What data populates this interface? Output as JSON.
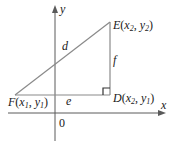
{
  "diagram": {
    "type": "right-triangle-distance",
    "axes": {
      "x_label": "x",
      "y_label": "y",
      "origin_label": "0"
    },
    "points": {
      "E": {
        "name": "E",
        "x_sub": "2",
        "y_sub": "2"
      },
      "D": {
        "name": "D",
        "x_sub": "2",
        "y_sub": "1"
      },
      "F": {
        "name": "F",
        "x_sub": "1",
        "y_sub": "1"
      }
    },
    "sides": {
      "hypotenuse": "d",
      "vertical": "f",
      "horizontal": "e"
    },
    "colors": {
      "triangle": "#8a8a8a",
      "axes": "#5a5a5a",
      "text": "#1a1a1a"
    }
  }
}
